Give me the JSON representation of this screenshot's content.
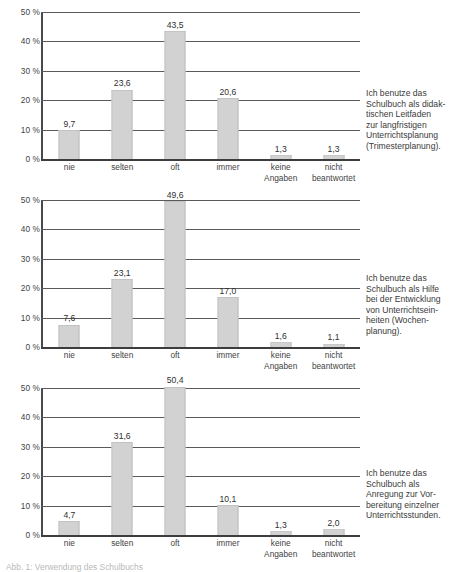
{
  "chart_data": [
    {
      "type": "bar",
      "title": "",
      "xlabel": "",
      "ylabel": "",
      "ylim": [
        0,
        50
      ],
      "yticks": [
        0,
        10,
        20,
        30,
        40,
        50
      ],
      "ytick_labels": [
        "0 %",
        "10 %",
        "20 %",
        "30 %",
        "40 %",
        "50 %"
      ],
      "grid": true,
      "legend": "none",
      "categories": [
        "nie",
        "selten",
        "oft",
        "immer",
        "keine Angaben",
        "nicht beantwortet"
      ],
      "category_lines": [
        [
          "nie"
        ],
        [
          "selten"
        ],
        [
          "oft"
        ],
        [
          "immer"
        ],
        [
          "keine",
          "Angaben"
        ],
        [
          "nicht",
          "beantwortet"
        ]
      ],
      "values": [
        9.7,
        23.6,
        43.5,
        20.6,
        1.3,
        1.3
      ],
      "value_labels": [
        "9,7",
        "23,6",
        "43,5",
        "20,6",
        "1,3",
        "1,3"
      ],
      "caption_lines": [
        "Ich benutze das",
        "Schulbuch als didak-",
        "tischen Leitfaden",
        "zur langfristigen",
        "Unterrichtsplanung",
        "(Trimesterplanung)."
      ],
      "caption": "Ich benutze das Schulbuch als didaktischen Leitfaden zur langfristigen Unterrichtsplanung (Trimesterplanung)."
    },
    {
      "type": "bar",
      "title": "",
      "xlabel": "",
      "ylabel": "",
      "ylim": [
        0,
        50
      ],
      "yticks": [
        0,
        10,
        20,
        30,
        40,
        50
      ],
      "ytick_labels": [
        "0 %",
        "10 %",
        "20 %",
        "30 %",
        "40 %",
        "50 %"
      ],
      "grid": true,
      "legend": "none",
      "categories": [
        "nie",
        "selten",
        "oft",
        "immer",
        "keine Angaben",
        "nicht beantwortet"
      ],
      "category_lines": [
        [
          "nie"
        ],
        [
          "selten"
        ],
        [
          "oft"
        ],
        [
          "immer"
        ],
        [
          "keine",
          "Angaben"
        ],
        [
          "nicht",
          "beantwortet"
        ]
      ],
      "values": [
        7.6,
        23.1,
        49.6,
        17.0,
        1.6,
        1.1
      ],
      "value_labels": [
        "7,6",
        "23,1",
        "49,6",
        "17,0",
        "1,6",
        "1,1"
      ],
      "caption_lines": [
        "Ich benutze das",
        "Schulbuch als Hilfe",
        "bei der Entwicklung",
        "von Unterrichtsein-",
        "heiten (Wochen-",
        "planung)."
      ],
      "caption": "Ich benutze das Schulbuch als Hilfe bei der Entwicklung von Unterrichtseinheiten (Wochenplanung)."
    },
    {
      "type": "bar",
      "title": "",
      "xlabel": "",
      "ylabel": "",
      "ylim": [
        0,
        50
      ],
      "yticks": [
        0,
        10,
        20,
        30,
        40,
        50
      ],
      "ytick_labels": [
        "0 %",
        "10 %",
        "20 %",
        "30 %",
        "40 %",
        "50 %"
      ],
      "grid": true,
      "legend": "none",
      "categories": [
        "nie",
        "selten",
        "oft",
        "immer",
        "keine Angaben",
        "nicht beantwortet"
      ],
      "category_lines": [
        [
          "nie"
        ],
        [
          "selten"
        ],
        [
          "oft"
        ],
        [
          "immer"
        ],
        [
          "keine",
          "Angaben"
        ],
        [
          "nicht",
          "beantwortet"
        ]
      ],
      "values": [
        4.7,
        31.6,
        50.4,
        10.1,
        1.3,
        2.0
      ],
      "value_labels": [
        "4,7",
        "31,6",
        "50,4",
        "10,1",
        "1,3",
        "2,0"
      ],
      "caption_lines": [
        "Ich benutze das",
        "Schulbuch als",
        "Anregung zur Vor-",
        "bereitung einzelner",
        "Unterrichtsstunden."
      ],
      "caption": "Ich benutze das Schulbuch als Anregung zur Vorbereitung einzelner Unterrichtsstunden."
    }
  ],
  "footnote": {
    "text": "Abb. 1: Verwendung des Schulbuchs"
  },
  "colors": {
    "bar_fill": "#d2d2d2",
    "bar_edge": "#c3c3c3",
    "gridline": "#5a5a5a",
    "axis": "#4a4a4a",
    "text": "#3a3a3a",
    "background": "#ffffff"
  }
}
